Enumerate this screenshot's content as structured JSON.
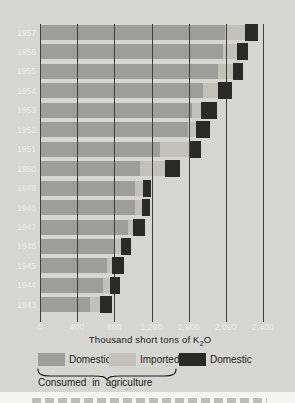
{
  "chart_data": {
    "type": "bar",
    "orientation": "horizontal",
    "title": "",
    "xlabel_prefix": "Thousand short tons of K",
    "xlabel_sub": "2",
    "xlabel_suffix": "O",
    "xlim": [
      0,
      2400
    ],
    "grid": "vertical-lines-on",
    "x_ticks": [
      {
        "value": 0,
        "label": "0"
      },
      {
        "value": 400,
        "label": "400"
      },
      {
        "value": 800,
        "label": "800"
      },
      {
        "value": 1200,
        "label": "1,200"
      },
      {
        "value": 1600,
        "label": "1,600"
      },
      {
        "value": 2000,
        "label": "2,000"
      },
      {
        "value": 2400,
        "label": "2,400"
      }
    ],
    "categories": [
      "1957",
      "1956",
      "1955",
      "1954",
      "1953",
      "1952",
      "1951",
      "1950",
      "1949",
      "1948",
      "1947",
      "1946",
      "1945",
      "1944",
      "1943"
    ],
    "series": [
      {
        "name": "Domestic (consumed in agriculture)",
        "color": "#9e9e99",
        "values": [
          1990,
          1970,
          1915,
          1750,
          1635,
          1590,
          1290,
          1075,
          1020,
          1020,
          945,
          795,
          720,
          680,
          540
        ]
      },
      {
        "name": "Imported (consumed in agriculture)",
        "color": "#c1c1ba",
        "values": [
          215,
          150,
          160,
          165,
          95,
          90,
          320,
          270,
          90,
          80,
          55,
          75,
          55,
          75,
          105
        ]
      },
      {
        "name": "Domestic (other uses)",
        "color": "#2a2a27",
        "values": [
          140,
          120,
          110,
          150,
          175,
          150,
          120,
          160,
          85,
          85,
          125,
          110,
          130,
          105,
          130
        ]
      }
    ],
    "legend": {
      "position": "bottom",
      "entries": [
        {
          "label": "Domestic",
          "color": "#9e9e99"
        },
        {
          "label": "Imported",
          "color": "#c1c1ba"
        },
        {
          "label": "Domestic",
          "color": "#2a2a27"
        }
      ],
      "brace_label": "Consumed in agriculture"
    }
  },
  "colors": {
    "panel_background": "#d6d6d1",
    "outer_background": "#f4f4f0",
    "gridline": "#3e3e3c",
    "axis_text_light": "#ebebe6",
    "dark_text": "#1b1b19",
    "top_strip": "#20201e"
  }
}
